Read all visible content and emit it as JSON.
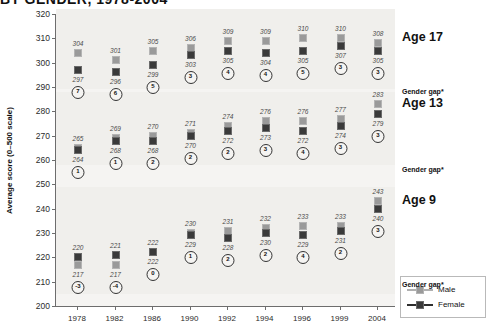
{
  "title": "BY GENDER, 1978-2004",
  "axis": {
    "ylabel": "Average score (0–500 scale)",
    "yticks": [
      "320",
      "310",
      "300",
      "290",
      "280",
      "270",
      "260",
      "250",
      "240",
      "230",
      "220",
      "210",
      "200"
    ]
  },
  "legend": {
    "male": "Male",
    "female": "Female"
  },
  "panels": {
    "age17": {
      "title": "Age 17",
      "gap_label": "Gender gap*"
    },
    "age13": {
      "title": "Age 13",
      "gap_label": "Gender gap*"
    },
    "age9": {
      "title": "Age 9",
      "gap_label": "Gender gap*"
    }
  },
  "chart_data": {
    "type": "line",
    "title": "BY GENDER, 1978-2004",
    "xlabel": "",
    "ylabel": "Average score (0–500 scale)",
    "ylim": [
      200,
      320
    ],
    "ytick_step": 10,
    "grid": false,
    "legend_position": "bottom-right",
    "categories": [
      "1978",
      "1982",
      "1986",
      "1990",
      "1992",
      "1994",
      "1996",
      "1999",
      "2004"
    ],
    "groups": [
      {
        "name": "Age 17",
        "series": [
          {
            "name": "Male",
            "values": [
              304,
              301,
              305,
              306,
              309,
              309,
              310,
              310,
              308
            ]
          },
          {
            "name": "Female",
            "values": [
              297,
              296,
              299,
              303,
              305,
              304,
              305,
              307,
              305
            ]
          }
        ],
        "gender_gap": [
          7,
          6,
          5,
          3,
          4,
          4,
          5,
          3,
          3
        ]
      },
      {
        "name": "Age 13",
        "series": [
          {
            "name": "Male",
            "values": [
              265,
              269,
              270,
              271,
              274,
              276,
              276,
              277,
              283
            ]
          },
          {
            "name": "Female",
            "values": [
              264,
              268,
              268,
              270,
              272,
              273,
              272,
              274,
              279
            ]
          }
        ],
        "gender_gap": [
          1,
          1,
          2,
          2,
          2,
          3,
          4,
          3,
          3
        ]
      },
      {
        "name": "Age 9",
        "series": [
          {
            "name": "Male",
            "values": [
              217,
              217,
              222,
              230,
              231,
              232,
              233,
              233,
              243
            ]
          },
          {
            "name": "Female",
            "values": [
              220,
              221,
              222,
              229,
              228,
              230,
              229,
              231,
              240
            ]
          }
        ],
        "gender_gap": [
          -3,
          -4,
          0,
          1,
          2,
          2,
          4,
          2,
          3
        ]
      }
    ]
  }
}
